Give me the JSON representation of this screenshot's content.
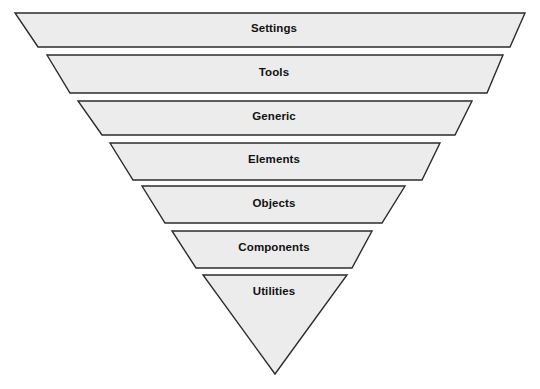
{
  "diagram": {
    "type": "inverted-pyramid-funnel",
    "title": "",
    "orientation": "top-wide-to-bottom-narrow",
    "background_color": "#ffffff",
    "layer_fill_color": "#ececec",
    "layer_stroke_color": "#2b2b2b",
    "label_color": "#111111",
    "layer_count": 7,
    "layers": [
      {
        "index": 1,
        "label": "Settings",
        "shape": "trapezoid",
        "label_x": 274,
        "label_y": 29,
        "points": "15,13 525,13 510,47 38,47"
      },
      {
        "index": 2,
        "label": "Tools",
        "shape": "trapezoid",
        "label_x": 274,
        "label_y": 73,
        "points": "47,55 503,55 487,93 70,93"
      },
      {
        "index": 3,
        "label": "Generic",
        "shape": "trapezoid",
        "label_x": 274,
        "label_y": 117,
        "points": "78,101 472,101 455,135 102,135"
      },
      {
        "index": 4,
        "label": "Elements",
        "shape": "trapezoid",
        "label_x": 274,
        "label_y": 160,
        "points": "110,143 440,143 422,180 133,180"
      },
      {
        "index": 5,
        "label": "Objects",
        "shape": "trapezoid",
        "label_x": 274,
        "label_y": 204,
        "points": "142,186 405,186 382,223 165,223"
      },
      {
        "index": 6,
        "label": "Components",
        "shape": "trapezoid",
        "label_x": 274,
        "label_y": 248,
        "points": "172,231 372,231 352,268 196,268"
      },
      {
        "index": 7,
        "label": "Utilities",
        "shape": "triangle",
        "label_x": 274,
        "label_y": 292,
        "points": "203,275 347,275 275,374"
      }
    ]
  }
}
